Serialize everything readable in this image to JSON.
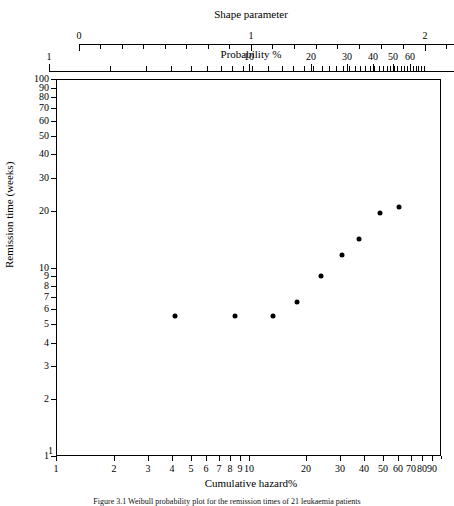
{
  "figure": {
    "caption": "Figure 3.1  Weibull probability plot for the remission times of 21 leukaemia patients",
    "background": "#ffffff",
    "ink": "#000000"
  },
  "top_axis_shape": {
    "title": "Shape parameter",
    "ticks": [
      {
        "value": "0",
        "x": 79,
        "labeled": true
      },
      {
        "value": "",
        "x": 100,
        "labeled": false
      },
      {
        "value": "",
        "x": 122,
        "labeled": false
      },
      {
        "value": "",
        "x": 143,
        "labeled": false
      },
      {
        "value": "",
        "x": 165,
        "labeled": false
      },
      {
        "value": "",
        "x": 186,
        "labeled": false
      },
      {
        "value": "",
        "x": 208,
        "labeled": false
      },
      {
        "value": "",
        "x": 229,
        "labeled": false
      },
      {
        "value": "1",
        "x": 251,
        "labeled": true
      },
      {
        "value": "",
        "x": 272,
        "labeled": false
      },
      {
        "value": "",
        "x": 294,
        "labeled": false
      },
      {
        "value": "",
        "x": 316,
        "labeled": false
      },
      {
        "value": "",
        "x": 337,
        "labeled": false
      },
      {
        "value": "",
        "x": 359,
        "labeled": false
      },
      {
        "value": "",
        "x": 381,
        "labeled": false
      },
      {
        "value": "",
        "x": 403,
        "labeled": false
      },
      {
        "value": "2",
        "x": 425,
        "labeled": true
      },
      {
        "value": "",
        "x": 446,
        "labeled": false
      }
    ],
    "line": {
      "x0": 79,
      "x1": 454,
      "y": 44
    }
  },
  "top_axis_probability": {
    "title": "Probability %",
    "labeled_ticks": [
      {
        "value": "1",
        "x": 49
      },
      {
        "value": "10",
        "x": 249
      },
      {
        "value": "20",
        "x": 311
      },
      {
        "value": "30",
        "x": 347
      },
      {
        "value": "40",
        "x": 373
      },
      {
        "value": "50",
        "x": 393
      },
      {
        "value": "60",
        "x": 410
      }
    ],
    "line": {
      "x0": 49,
      "x1": 454,
      "y": 71
    }
  },
  "y_axis": {
    "title": "Remission time (weeks)",
    "scale": "log",
    "min": 1,
    "max": 100,
    "labeled_ticks": [
      "100",
      "90",
      "80",
      "70",
      "60",
      "50",
      "40",
      "30",
      "20",
      "10",
      "9",
      "8",
      "7",
      "6",
      "5",
      "4",
      "3",
      "2",
      "1"
    ]
  },
  "x_axis": {
    "title": "Cumulative hazard%",
    "scale": "log",
    "min": 1,
    "max": 100,
    "labeled_ticks": [
      "1",
      "2",
      "3",
      "4",
      "5",
      "6",
      "7",
      "8",
      "9",
      "10",
      "20",
      "30",
      "40",
      "50",
      "60",
      "70",
      "80",
      "90"
    ]
  },
  "chart_data": {
    "type": "scatter",
    "title": "",
    "xlabel": "Cumulative hazard%",
    "ylabel": "Remission time (weeks)",
    "xscale": "log",
    "yscale": "log",
    "xlim": [
      1,
      100
    ],
    "ylim": [
      1,
      100
    ],
    "grid": false,
    "legend": null,
    "secondary_axes": [
      {
        "name": "Shape parameter",
        "position": "top",
        "range": [
          0,
          2
        ]
      },
      {
        "name": "Probability %",
        "position": "top",
        "scale": "log",
        "ticks": [
          1,
          10,
          20,
          30,
          40,
          50,
          60
        ]
      }
    ],
    "series": [
      {
        "name": "remission times",
        "marker": "filled-circle",
        "color": "#000000",
        "points": [
          {
            "x": 4.8,
            "y": 6,
            "px": 174,
            "py": 315
          },
          {
            "x": 9.7,
            "y": 6,
            "px": 234,
            "py": 315
          },
          {
            "x": 16.0,
            "y": 6,
            "px": 272,
            "py": 315
          },
          {
            "x": 21.5,
            "y": 7,
            "px": 296,
            "py": 301
          },
          {
            "x": 27.5,
            "y": 10,
            "px": 320,
            "py": 275
          },
          {
            "x": 34.0,
            "y": 13,
            "px": 341,
            "py": 254
          },
          {
            "x": 41.0,
            "y": 16,
            "px": 358,
            "py": 238
          },
          {
            "x": 53.0,
            "y": 22,
            "px": 379,
            "py": 212
          },
          {
            "x": 65.0,
            "y": 23,
            "px": 398,
            "py": 206
          }
        ]
      }
    ]
  }
}
